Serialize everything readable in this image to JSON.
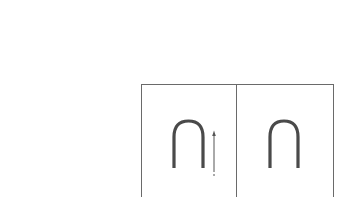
{
  "figure": {
    "panels": [
      {
        "id": "left",
        "shape": "inverted-u",
        "has_arrow": true,
        "arrow_direction": "up"
      },
      {
        "id": "right",
        "shape": "inverted-u",
        "has_arrow": false
      }
    ],
    "colors": {
      "line": "#6a6a6a",
      "shape": "#4a4a4a",
      "arrow": "#555555",
      "background": "#ffffff"
    }
  }
}
